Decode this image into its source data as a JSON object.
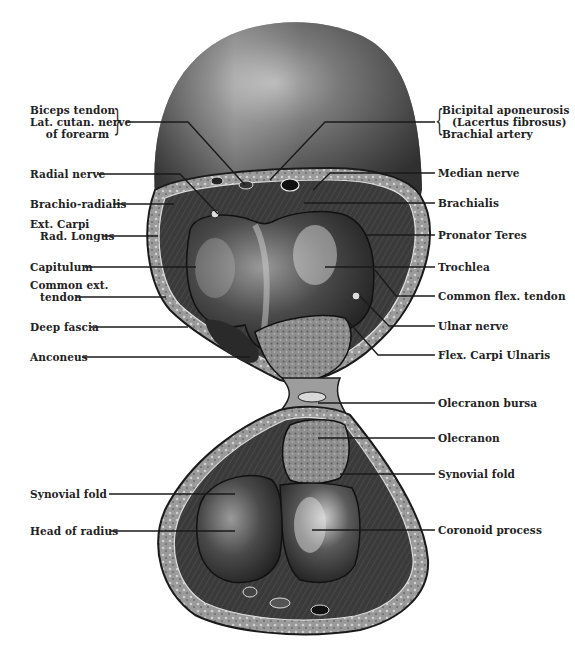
{
  "figure": {
    "type": "anatomical cross-section",
    "palette": {
      "background": "#ffffff",
      "skin_dark": "#3a3a3a",
      "skin_mid": "#6e6e6e",
      "skin_light": "#c9c9c9",
      "bone": "#8a8a8a",
      "cartilage_dark": "#2e2e2e",
      "line": "#1a1a1a"
    }
  },
  "labels_left": [
    {
      "id": "biceps-tendon",
      "lines": [
        "Biceps tendon",
        "Lat. cutan. nerve",
        "of forearm"
      ]
    },
    {
      "id": "radial-nerve",
      "lines": [
        "Radial nerve"
      ]
    },
    {
      "id": "brachio-radialis",
      "lines": [
        "Brachio-radialis"
      ]
    },
    {
      "id": "ext-carpi-rad-longus",
      "lines": [
        "Ext. Carpi",
        "Rad. Longus"
      ]
    },
    {
      "id": "capitulum",
      "lines": [
        "Capitulum"
      ]
    },
    {
      "id": "common-ext-tendon",
      "lines": [
        "Common ext.",
        "tendon"
      ]
    },
    {
      "id": "deep-fascia",
      "lines": [
        "Deep fascia"
      ]
    },
    {
      "id": "anconeus",
      "lines": [
        "Anconeus"
      ]
    },
    {
      "id": "synovial-fold-left",
      "lines": [
        "Synovial fold"
      ]
    },
    {
      "id": "head-of-radius",
      "lines": [
        "Head of radius"
      ]
    }
  ],
  "labels_right": [
    {
      "id": "bicipital-aponeurosis",
      "lines": [
        "Bicipital aponeurosis",
        "(Lacertus fibrosus)",
        "Brachial artery"
      ]
    },
    {
      "id": "median-nerve",
      "lines": [
        "Median nerve"
      ]
    },
    {
      "id": "brachialis",
      "lines": [
        "Brachialis"
      ]
    },
    {
      "id": "pronator-teres",
      "lines": [
        "Pronator Teres"
      ]
    },
    {
      "id": "trochlea",
      "lines": [
        "Trochlea"
      ]
    },
    {
      "id": "common-flex-tendon",
      "lines": [
        "Common flex. tendon"
      ]
    },
    {
      "id": "ulnar-nerve",
      "lines": [
        "Ulnar nerve"
      ]
    },
    {
      "id": "flex-carpi-ulnaris",
      "lines": [
        "Flex. Carpi Ulnaris"
      ]
    },
    {
      "id": "olecranon-bursa",
      "lines": [
        "Olecranon bursa"
      ]
    },
    {
      "id": "olecranon",
      "lines": [
        "Olecranon"
      ]
    },
    {
      "id": "synovial-fold-right",
      "lines": [
        "Synovial fold"
      ]
    },
    {
      "id": "coronoid-process",
      "lines": [
        "Coronoid process"
      ]
    }
  ]
}
